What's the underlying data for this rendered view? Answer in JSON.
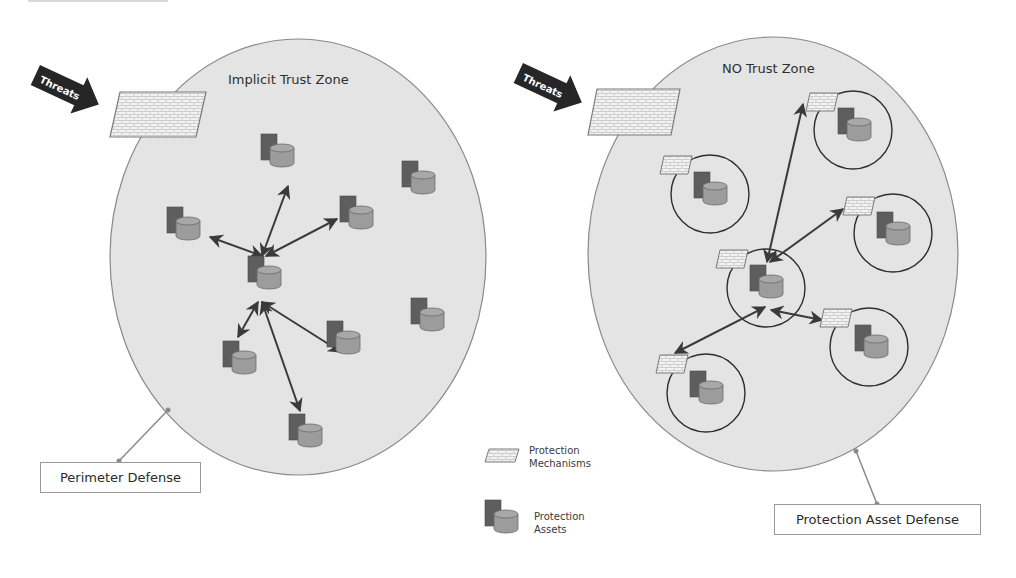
{
  "left_diagram": {
    "title": "Implicit Trust Zone",
    "threat_label": "Threats",
    "callout_label": "Perimeter Defense"
  },
  "right_diagram": {
    "title": "NO Trust Zone",
    "threat_label": "Threats",
    "callout_label": "Protection Asset Defense"
  },
  "legend": {
    "items": [
      {
        "icon": "firewall-icon",
        "line1": "Protection",
        "line2": "Mechanisms"
      },
      {
        "icon": "asset-icon",
        "line1": "Protection",
        "line2": "Assets"
      }
    ]
  },
  "colors": {
    "zone_fill": "#e4e4e4",
    "zone_stroke": "#8a8a8a",
    "asset_server": "#5e5e5e",
    "asset_db": "#9c9c9c",
    "arrow": "#3a3a3a",
    "threat_arrow": "#262626",
    "firewall_fill": "#f2f2f2"
  }
}
